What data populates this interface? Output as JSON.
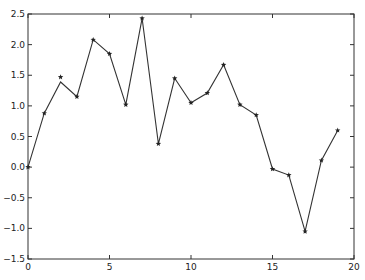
{
  "chart_data": {
    "type": "line",
    "title": "",
    "xlabel": "",
    "ylabel": "",
    "xlim": [
      0,
      20
    ],
    "ylim": [
      -1.5,
      2.5
    ],
    "grid": false,
    "legend": null,
    "x_ticks": [
      "0",
      "5",
      "10",
      "15",
      "20"
    ],
    "y_ticks": [
      "-1.5",
      "-1.0",
      "-0.5",
      "0.0",
      "0.5",
      "1.0",
      "1.5",
      "2.0",
      "2.5"
    ],
    "x": [
      0,
      1,
      2,
      3,
      4,
      5,
      6,
      7,
      8,
      9,
      10,
      11,
      12,
      13,
      14,
      15,
      16,
      17,
      18,
      19
    ],
    "series": [
      {
        "name": "line",
        "style": "solid line",
        "values": [
          0.0,
          0.88,
          1.39,
          1.15,
          2.08,
          1.85,
          1.02,
          2.43,
          0.38,
          1.45,
          1.05,
          1.21,
          1.67,
          1.02,
          0.85,
          -0.03,
          -0.13,
          -1.05,
          0.11,
          0.6
        ]
      },
      {
        "name": "markers",
        "style": "star markers",
        "values": [
          0.0,
          0.88,
          1.47,
          1.15,
          2.08,
          1.85,
          1.02,
          2.43,
          0.38,
          1.45,
          1.05,
          1.21,
          1.67,
          1.02,
          0.85,
          -0.03,
          -0.13,
          -1.05,
          0.11,
          0.6
        ]
      }
    ],
    "colors": {
      "line": "#333333",
      "marker": "#222222",
      "axes": "#333333"
    }
  }
}
